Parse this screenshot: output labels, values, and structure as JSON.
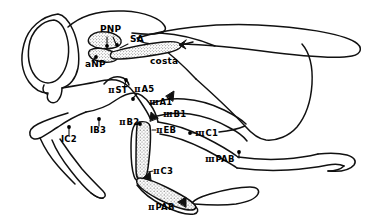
{
  "figure": {
    "line_color": "#111111",
    "fill_color": "#ffffff",
    "stipple_color": "#3a3a3a",
    "width": 374,
    "height": 224
  },
  "labels": [
    {
      "id": "pnp",
      "numeral": "",
      "text": "PNP",
      "x": 99,
      "y": 29,
      "leader": "down"
    },
    {
      "id": "sa",
      "numeral": "",
      "text": "SA",
      "x": 129,
      "y": 40,
      "leader": "down-left"
    },
    {
      "id": "anp",
      "numeral": "",
      "text": "aNP",
      "x": 86,
      "y": 62,
      "leader": "up-right"
    },
    {
      "id": "costa",
      "numeral": "",
      "text": "costa",
      "x": 151,
      "y": 60,
      "leader": "none"
    },
    {
      "id": "ii-st",
      "numeral": "II",
      "text": "ST",
      "x": 110,
      "y": 90,
      "leader": "up-right"
    },
    {
      "id": "ii-a5",
      "numeral": "II",
      "text": "A5",
      "x": 136,
      "y": 88,
      "leader": "down-left"
    },
    {
      "id": "iii-a1",
      "numeral": "III",
      "text": "A1",
      "x": 151,
      "y": 102,
      "leader": "right"
    },
    {
      "id": "iii-b1",
      "numeral": "III",
      "text": "B1",
      "x": 164,
      "y": 113,
      "leader": "left"
    },
    {
      "id": "ii-b2",
      "numeral": "II",
      "text": "B2",
      "x": 121,
      "y": 121,
      "leader": "right"
    },
    {
      "id": "i-b3",
      "numeral": "",
      "text": "IB3",
      "x": 91,
      "y": 129,
      "leader": "up"
    },
    {
      "id": "i-c2",
      "numeral": "",
      "text": "IC2",
      "x": 62,
      "y": 138,
      "leader": "up"
    },
    {
      "id": "ii-eb",
      "numeral": "II",
      "text": "EB",
      "x": 157,
      "y": 129,
      "leader": "left"
    },
    {
      "id": "iii-c1",
      "numeral": "III",
      "text": "C1",
      "x": 196,
      "y": 132,
      "leader": "left"
    },
    {
      "id": "iii-pab",
      "numeral": "III",
      "text": "PAB",
      "x": 206,
      "y": 158,
      "leader": "up-right"
    },
    {
      "id": "ii-c3",
      "numeral": "II",
      "text": "C3",
      "x": 154,
      "y": 170,
      "leader": "left"
    },
    {
      "id": "ii-pab",
      "numeral": "II",
      "text": "PAB",
      "x": 149,
      "y": 205,
      "leader": "up-right"
    }
  ],
  "numerals": {
    "II": "Ⅱ",
    "III": "Ⅲ"
  }
}
